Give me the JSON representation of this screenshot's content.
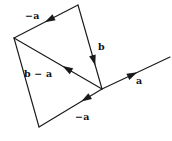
{
  "figure": {
    "type": "vector-diagram",
    "background_color": "#ffffff",
    "stroke_color": "#1a1a1a",
    "text_color": "#111111"
  },
  "points": {
    "top": {
      "name": "top-vertex",
      "x": 78,
      "y": 5
    },
    "left": {
      "name": "left-vertex",
      "x": 14,
      "y": 38
    },
    "junction": {
      "name": "junction-vertex",
      "x": 102,
      "y": 89
    },
    "bottomleft": {
      "name": "bottom-left-vertex",
      "x": 39,
      "y": 127
    },
    "farright": {
      "name": "far-right-endpoint",
      "x": 170,
      "y": 57
    }
  },
  "edges": [
    {
      "id": "edge-minus-a-top",
      "label_id": "label-minus-a-top",
      "from": "top",
      "to": "left",
      "arrow_at": 0.52,
      "arrow_direction": "toward-left-vertex",
      "has_arrow": true
    },
    {
      "id": "edge-b",
      "label_id": "label-b",
      "from": "top",
      "to": "junction",
      "arrow_at": 0.72,
      "arrow_direction": "toward-junction",
      "has_arrow": true
    },
    {
      "id": "edge-b-minus-a",
      "label_id": "label-b-minus-a",
      "from": "junction",
      "to": "left",
      "arrow_at": 0.45,
      "arrow_direction": "toward-left-vertex",
      "has_arrow": true
    },
    {
      "id": "edge-left-side",
      "label_id": null,
      "from": "left",
      "to": "bottomleft",
      "arrow_at": null,
      "arrow_direction": null,
      "has_arrow": false
    },
    {
      "id": "edge-minus-a-bottom",
      "label_id": "label-minus-a-bottom",
      "from": "junction",
      "to": "bottomleft",
      "arrow_at": 0.33,
      "arrow_direction": "toward-bottom-left-vertex",
      "has_arrow": true
    },
    {
      "id": "edge-a",
      "label_id": "label-a",
      "from": "junction",
      "to": "farright",
      "arrow_at": 0.52,
      "arrow_direction": "toward-far-right",
      "has_arrow": true
    }
  ],
  "labels": {
    "minus_a_top": {
      "minus": "−",
      "vector": "a",
      "full_text": "−a",
      "x": 25,
      "y": 11
    },
    "b": {
      "vector": "b",
      "full_text": "b",
      "x": 98,
      "y": 42
    },
    "b_minus_a": {
      "first": "b",
      "operator": "−",
      "second": "a",
      "full_text": "b − a",
      "x": 24,
      "y": 69
    },
    "minus_a_bottom": {
      "minus": "−",
      "vector": "a",
      "full_text": "−a",
      "x": 75,
      "y": 112
    },
    "a": {
      "vector": "a",
      "full_text": "a",
      "x": 136,
      "y": 76
    }
  }
}
